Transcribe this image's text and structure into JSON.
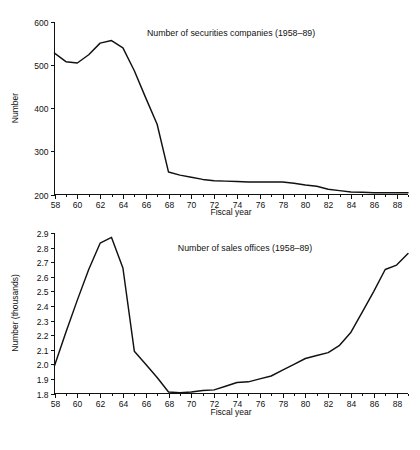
{
  "page": {
    "background_color": "#ffffff",
    "ink_color": "#111111",
    "partial_text_top": "",
    "partial_text_bottom": ""
  },
  "charts": [
    {
      "id": "securities-companies",
      "title": "Number of securities companies (1958–89)",
      "xlabel": "Fiscal year",
      "ylabel": "Number"
    },
    {
      "id": "sales-offices",
      "title": "Number of sales offices (1958–89)",
      "xlabel": "Fiscal year",
      "ylabel": "Number (thousands)"
    }
  ],
  "chart_data": [
    {
      "type": "line",
      "id": "securities-companies",
      "title": "Number of securities companies (1958–89)",
      "xlabel": "Fiscal year",
      "ylabel": "Number",
      "xlim": [
        58,
        89
      ],
      "ylim": [
        200,
        600
      ],
      "ytick_labels": [
        "200",
        "300",
        "400",
        "500",
        "600"
      ],
      "yticks": [
        200,
        300,
        400,
        500,
        600
      ],
      "xtick_labels": [
        "58",
        "60",
        "62",
        "64",
        "66",
        "68",
        "70",
        "72",
        "74",
        "76",
        "78",
        "80",
        "82",
        "84",
        "86",
        "88"
      ],
      "xticks_major": [
        58,
        60,
        62,
        64,
        66,
        68,
        70,
        72,
        74,
        76,
        78,
        80,
        82,
        84,
        86,
        88
      ],
      "xticks_minor": [
        59,
        61,
        63,
        65,
        67,
        69,
        71,
        73,
        75,
        77,
        79,
        81,
        83,
        85,
        87,
        89
      ],
      "grid": false,
      "legend": "none",
      "x": [
        58,
        59,
        60,
        61,
        62,
        63,
        64,
        65,
        66,
        67,
        68,
        69,
        70,
        71,
        72,
        73,
        74,
        75,
        76,
        77,
        78,
        79,
        80,
        81,
        82,
        83,
        84,
        85,
        86,
        87,
        88,
        89
      ],
      "values": [
        528,
        508,
        505,
        524,
        551,
        557,
        540,
        487,
        424,
        363,
        252,
        245,
        240,
        235,
        232,
        231,
        230,
        229,
        229,
        229,
        229,
        226,
        222,
        219,
        212,
        209,
        206,
        205,
        204,
        204,
        204,
        204
      ]
    },
    {
      "type": "line",
      "id": "sales-offices",
      "title": "Number of sales offices (1958–89)",
      "xlabel": "Fiscal year",
      "ylabel": "Number (thousands)",
      "xlim": [
        58,
        89
      ],
      "ylim": [
        1.8,
        2.9
      ],
      "ytick_labels": [
        "1.8",
        "1.9",
        "2.0",
        "2.1",
        "2.2",
        "2.3",
        "2.4",
        "2.5",
        "2.6",
        "2.7",
        "2.8",
        "2.9"
      ],
      "yticks": [
        1.8,
        1.9,
        2.0,
        2.1,
        2.2,
        2.3,
        2.4,
        2.5,
        2.6,
        2.7,
        2.8,
        2.9
      ],
      "xtick_labels": [
        "58",
        "60",
        "62",
        "64",
        "66",
        "68",
        "70",
        "72",
        "74",
        "76",
        "78",
        "80",
        "82",
        "84",
        "86",
        "88"
      ],
      "xticks_major": [
        58,
        60,
        62,
        64,
        66,
        68,
        70,
        72,
        74,
        76,
        78,
        80,
        82,
        84,
        86,
        88
      ],
      "xticks_minor": [
        59,
        61,
        63,
        65,
        67,
        69,
        71,
        73,
        75,
        77,
        79,
        81,
        83,
        85,
        87,
        89
      ],
      "grid": false,
      "legend": "none",
      "x": [
        58,
        59,
        60,
        61,
        62,
        63,
        64,
        65,
        66,
        67,
        68,
        69,
        70,
        71,
        72,
        73,
        74,
        75,
        76,
        77,
        78,
        79,
        80,
        81,
        82,
        83,
        84,
        85,
        86,
        87,
        88,
        89
      ],
      "values": [
        1.99,
        2.22,
        2.44,
        2.65,
        2.83,
        2.87,
        2.66,
        2.09,
        2.0,
        1.91,
        1.81,
        1.805,
        1.81,
        1.82,
        1.825,
        1.85,
        1.875,
        1.88,
        1.9,
        1.92,
        1.96,
        2.0,
        2.04,
        2.06,
        2.08,
        2.13,
        2.22,
        2.36,
        2.5,
        2.65,
        2.68,
        2.76
      ]
    }
  ]
}
